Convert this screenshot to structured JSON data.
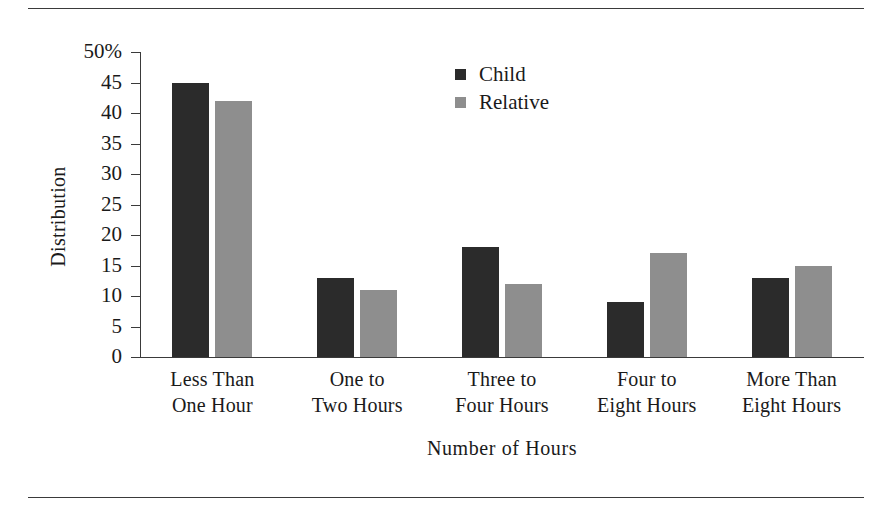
{
  "chart_data": {
    "type": "bar",
    "title": "",
    "xlabel": "Number of Hours",
    "ylabel": "Distribution",
    "categories": [
      "Less Than\nOne Hour",
      "One to\nTwo Hours",
      "Three to\nFour Hours",
      "Four to\nEight Hours",
      "More Than\nEight Hours"
    ],
    "category_lines": [
      [
        "Less Than",
        "One Hour"
      ],
      [
        "One to",
        "Two Hours"
      ],
      [
        "Three to",
        "Four Hours"
      ],
      [
        "Four to",
        "Eight Hours"
      ],
      [
        "More Than",
        "Eight Hours"
      ]
    ],
    "series": [
      {
        "name": "Child",
        "color": "#2b2b2b",
        "values": [
          45,
          13,
          18,
          9,
          13
        ]
      },
      {
        "name": "Relative",
        "color": "#8e8e8e",
        "values": [
          42,
          11,
          12,
          17,
          15
        ]
      }
    ],
    "ylim": [
      0,
      50
    ],
    "ytick_values": [
      0,
      5,
      10,
      15,
      20,
      25,
      30,
      35,
      40,
      45,
      50
    ],
    "ytick_labels": [
      "0",
      "5",
      "10",
      "15",
      "20",
      "25",
      "30",
      "35",
      "40",
      "45",
      "50%"
    ],
    "grid": false,
    "legend_position": "upper-center"
  },
  "legend": {
    "items": [
      {
        "label": "Child",
        "swatch": "child"
      },
      {
        "label": "Relative",
        "swatch": "relative"
      }
    ]
  },
  "axes": {
    "y_title": "Distribution",
    "x_title": "Number of Hours"
  }
}
